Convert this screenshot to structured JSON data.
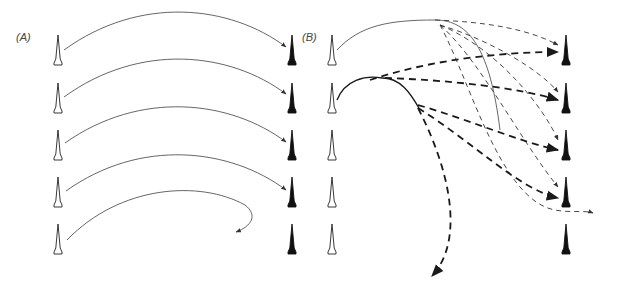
{
  "figure": {
    "panels": [
      {
        "id": "A",
        "label": "(A)",
        "label_pos": [
          16,
          37
        ],
        "source_tips": {
          "x": 58,
          "rows_top_y": [
            35,
            83,
            130,
            177,
            224
          ],
          "style": "outline"
        },
        "target_tips": {
          "x": 292,
          "rows_top_y": [
            35,
            83,
            130,
            177,
            224
          ],
          "style": "filled"
        },
        "trajectories": [
          {
            "path": "M 64 50 C 140 -5, 230 5, 286 47",
            "style": "solid-thin"
          },
          {
            "path": "M 64 97 C 140 42, 230 52, 286 94",
            "style": "solid-thin"
          },
          {
            "path": "M 65 143 C 140 90, 230 100, 286 142",
            "style": "solid-thin"
          },
          {
            "path": "M 66 191 C 140 138, 230 148, 286 190",
            "style": "solid-thin"
          },
          {
            "path": "M 67 240 C 120 185, 200 180, 245 205 C 258 215, 252 226, 236 232",
            "style": "solid-thin"
          }
        ]
      },
      {
        "id": "B",
        "label": "(B)",
        "label_pos": [
          302,
          37
        ],
        "source_tips": {
          "x": 332,
          "rows_top_y": [
            35,
            83,
            130,
            177,
            224
          ],
          "style": "outline"
        },
        "target_tips": {
          "x": 566,
          "rows_top_y": [
            35,
            83,
            130,
            177,
            224
          ],
          "style": "filled"
        },
        "trajectories": [
          {
            "path": "M 337 50 C 360 25, 390 20, 435 20",
            "style": "solid-thin"
          },
          {
            "path": "M 435 20 C 470 20, 490 50, 500 130",
            "style": "solid-thin"
          },
          {
            "path": "M 337 100 C 345 80, 365 75, 382 78",
            "style": "solid-medium"
          },
          {
            "path": "M 382 78 C 400 78, 410 92, 420 110",
            "style": "solid-medium"
          },
          {
            "path": "M 435 20 C 490 22, 530 30, 558 45",
            "style": "dashed"
          },
          {
            "path": "M 370 80 C 430 60, 500 52, 558 52",
            "style": "dashed-bold"
          },
          {
            "path": "M 385 78 C 450 80, 520 88, 558 100",
            "style": "dashed-bold"
          },
          {
            "path": "M 440 25 C 490 40, 540 70, 558 92",
            "style": "dashed"
          },
          {
            "path": "M 440 25 C 500 50, 545 110, 558 140",
            "style": "dashed"
          },
          {
            "path": "M 440 25 C 480 60, 520 140, 558 187",
            "style": "dashed"
          },
          {
            "path": "M 440 25 C 470 80, 500 200, 555 210 C 570 213, 585 210, 593 213",
            "style": "dashed"
          },
          {
            "path": "M 418 105 C 470 120, 520 142, 558 150",
            "style": "dashed-bold"
          },
          {
            "path": "M 418 108 C 470 140, 520 190, 558 198",
            "style": "dashed-bold"
          },
          {
            "path": "M 418 108 C 450 170, 465 240, 432 276",
            "style": "dashed-bold"
          }
        ]
      }
    ],
    "colors": {
      "background": "#ffffff",
      "line": "#1a1a1a",
      "thin_line": "#555555",
      "tip_fill": "#111111",
      "tip_outline": "#222222"
    }
  }
}
